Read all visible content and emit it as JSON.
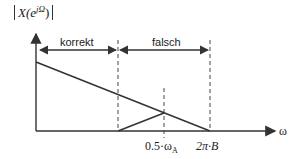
{
  "diagram": {
    "ylabel": "|X(e^{jΩ})|",
    "ylabel_main": "X(e",
    "ylabel_sup": "jΩ",
    "ylabel_close": ")",
    "xlabel": "ω",
    "regions": [
      {
        "label": "korrekt"
      },
      {
        "label": "falsch"
      }
    ],
    "ticks": [
      {
        "label": "0.5·ω",
        "sub": "A"
      },
      {
        "label": "2π·B"
      }
    ],
    "colors": {
      "line": "#333333",
      "background": "#ffffff"
    }
  }
}
